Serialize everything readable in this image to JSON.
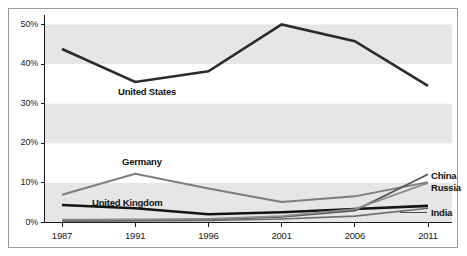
{
  "chart_data": {
    "type": "line",
    "title": "",
    "xlabel": "",
    "ylabel": "",
    "categories": [
      "1987",
      "1991",
      "1996",
      "2001",
      "2006",
      "2011"
    ],
    "ylim": [
      0,
      50
    ],
    "yticks": [
      0,
      10,
      20,
      30,
      40,
      50
    ],
    "ytick_labels": [
      "0%",
      "10%",
      "20%",
      "30%",
      "40%",
      "50%"
    ],
    "grid": false,
    "banding": true,
    "legend": "inline-labels",
    "series": [
      {
        "name": "United States",
        "label": "United States",
        "color": "#2b2b2b",
        "width": 2.6,
        "label_position": "below",
        "values": [
          43.8,
          35.5,
          38.2,
          50.0,
          45.8,
          34.5
        ]
      },
      {
        "name": "Germany",
        "label": "Germany",
        "color": "#7d7d7d",
        "width": 2.0,
        "label_position": "above",
        "values": [
          7.0,
          12.3,
          8.6,
          5.2,
          6.6,
          10.2
        ]
      },
      {
        "name": "United Kingdom",
        "label": "United Kingdom",
        "color": "#141414",
        "width": 2.6,
        "label_position": "above",
        "values": [
          4.4,
          3.6,
          2.1,
          2.6,
          3.4,
          4.2
        ]
      },
      {
        "name": "China",
        "label": "China",
        "color": "#555555",
        "width": 1.8,
        "label_position": "right",
        "values": [
          0.5,
          0.6,
          0.8,
          1.4,
          3.0,
          12.2
        ]
      },
      {
        "name": "Russia",
        "label": "Russia",
        "color": "#8c8c8c",
        "width": 1.8,
        "label_position": "right",
        "values": [
          0.7,
          0.8,
          0.9,
          1.6,
          3.4,
          10.0
        ]
      },
      {
        "name": "India",
        "label": "India",
        "color": "#6e6e6e",
        "width": 1.6,
        "label_position": "right-leader",
        "values": [
          0.3,
          0.4,
          0.5,
          0.9,
          1.6,
          3.6
        ]
      }
    ],
    "band_color": "#e6e6e6",
    "frame_color": "#9a9a9a",
    "axis_color": "#1a1a1a",
    "background": "#ffffff"
  }
}
